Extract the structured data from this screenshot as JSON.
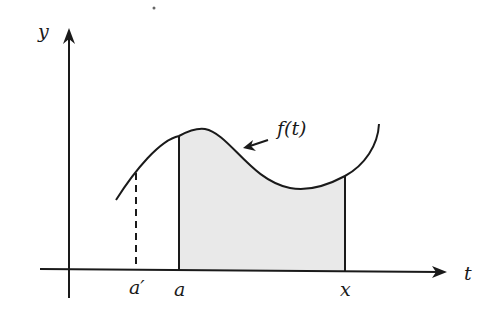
{
  "figure": {
    "axes": {
      "vertical_label": "y",
      "horizontal_label": "t"
    },
    "curve_label": "f(t)",
    "tick_labels": {
      "a_prime": "a′",
      "a": "a",
      "x": "x"
    },
    "shaded_region": {
      "from": "a",
      "to": "x",
      "fill": "#e8e8e8"
    },
    "colors": {
      "stroke": "#1a1a1a",
      "background": "#ffffff"
    }
  }
}
